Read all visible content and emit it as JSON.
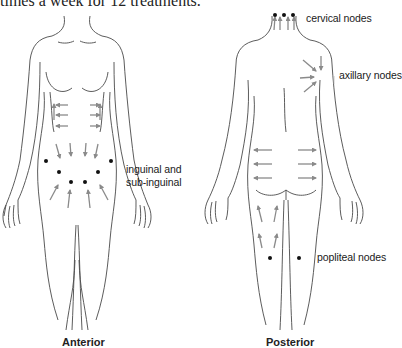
{
  "caption": {
    "text": "times a week for 12 treatments."
  },
  "figure": {
    "views": [
      {
        "id": "anterior",
        "label": "Anterior"
      },
      {
        "id": "posterior",
        "label": "Posterior"
      }
    ],
    "labels": {
      "cervical": "cervical nodes",
      "axillary": "axillary nodes",
      "inguinal_line1": "inguinal and",
      "inguinal_line2": "sub-inguinal",
      "popliteal": "popliteal nodes"
    },
    "colors": {
      "outline": "#4a4a4a",
      "arrow": "#8a8a8a",
      "node": "#111111"
    }
  }
}
